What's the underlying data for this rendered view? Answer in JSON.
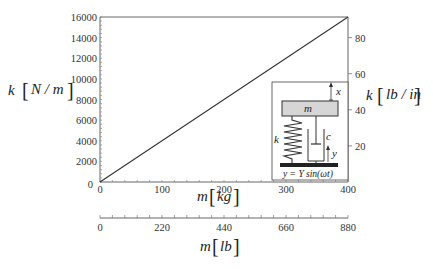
{
  "chart_data": {
    "type": "line",
    "title": "",
    "xlabel": "m [kg]",
    "ylabel": "k [N/m]",
    "secondary_xlabel": "m [lb]",
    "secondary_ylabel": "k [lb/in]",
    "xlim": [
      0,
      400
    ],
    "ylim": [
      0,
      16000
    ],
    "secondary_xlim": [
      0,
      880
    ],
    "secondary_ylim": [
      0,
      91.4
    ],
    "grid": false,
    "x_ticks": [
      "0",
      "100",
      "200",
      "300",
      "400"
    ],
    "y_ticks": [
      "0",
      "2000",
      "4000",
      "6000",
      "8000",
      "10000",
      "12000",
      "14000",
      "16000"
    ],
    "secondary_x_ticks": [
      "0",
      "220",
      "440",
      "660",
      "880"
    ],
    "secondary_y_ticks": [
      "20",
      "40",
      "60",
      "80"
    ],
    "series": [
      {
        "name": "k vs m",
        "x": [
          0,
          100,
          200,
          300,
          400
        ],
        "y": [
          0,
          4000,
          8000,
          12000,
          16000
        ]
      }
    ],
    "inset": {
      "description": "Base-excited spring-mass-damper schematic",
      "mass_label": "m",
      "spring_label": "k",
      "damper_label": "c",
      "mass_displacement_label": "x",
      "base_displacement_label": "y",
      "equation": "y = Y sin(ωt)"
    }
  },
  "labels": {
    "x_axis": {
      "var": "m",
      "unit": "kg"
    },
    "y_axis": {
      "var": "k",
      "unit": "N / m"
    },
    "x2_axis": {
      "var": "m",
      "unit": "lb"
    },
    "y2_axis": {
      "var": "k",
      "unit": "lb / in"
    }
  },
  "colors": {
    "line": "#333333",
    "axis": "#555555",
    "mass_fill": "#d6d6d6",
    "base_fill": "#222222"
  }
}
